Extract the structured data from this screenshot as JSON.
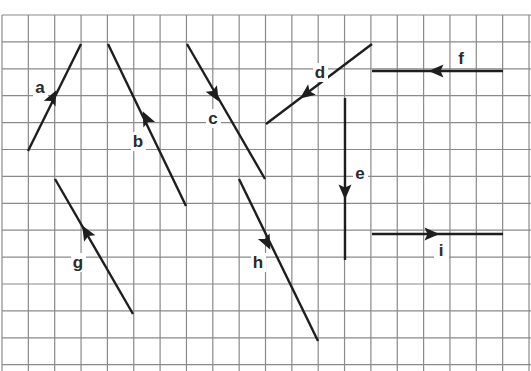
{
  "figure": {
    "grid": {
      "x0": 2,
      "dx": 26.35,
      "cols": 20,
      "y0": 15,
      "dy": 26.9,
      "rows": 13,
      "line_color": "#8a8a8a"
    },
    "vector_color": "#1e1e1e",
    "vectors": [
      {
        "label": "a",
        "from": [
          28,
          151
        ],
        "to": [
          81,
          44
        ],
        "arrow_at": [
          53,
          97
        ],
        "direction": "up-right",
        "label_pos": [
          40,
          93
        ]
      },
      {
        "label": "b",
        "from": [
          186,
          206
        ],
        "to": [
          108,
          44
        ],
        "arrow_at": [
          146,
          118
        ],
        "direction": "up-left",
        "label_pos": [
          138,
          147
        ]
      },
      {
        "label": "c",
        "from": [
          187,
          44
        ],
        "to": [
          265,
          179
        ],
        "arrow_at": [
          215,
          95
        ],
        "direction": "down-right",
        "label_pos": [
          213,
          124
        ]
      },
      {
        "label": "d",
        "from": [
          372,
          44
        ],
        "to": [
          266,
          124
        ],
        "arrow_at": [
          306,
          94
        ],
        "direction": "down-left",
        "label_pos": [
          320,
          78
        ]
      },
      {
        "label": "e",
        "from": [
          345,
          98
        ],
        "to": [
          345,
          260
        ],
        "arrow_at": [
          345,
          192
        ],
        "direction": "down",
        "label_pos": [
          360,
          179
        ]
      },
      {
        "label": "f",
        "from": [
          503,
          71
        ],
        "to": [
          372,
          71
        ],
        "arrow_at": [
          436,
          71
        ],
        "direction": "left",
        "label_pos": [
          461,
          64
        ]
      },
      {
        "label": "g",
        "from": [
          133,
          314
        ],
        "to": [
          55,
          179
        ],
        "arrow_at": [
          86,
          232
        ],
        "direction": "up-left",
        "label_pos": [
          78,
          268
        ]
      },
      {
        "label": "h",
        "from": [
          239,
          179
        ],
        "to": [
          318,
          341
        ],
        "arrow_at": [
          267,
          243
        ],
        "direction": "down-right",
        "label_pos": [
          258,
          268
        ]
      },
      {
        "label": "i",
        "from": [
          372,
          234
        ],
        "to": [
          503,
          234
        ],
        "arrow_at": [
          432,
          234
        ],
        "direction": "right",
        "label_pos": [
          441,
          256
        ]
      }
    ]
  }
}
